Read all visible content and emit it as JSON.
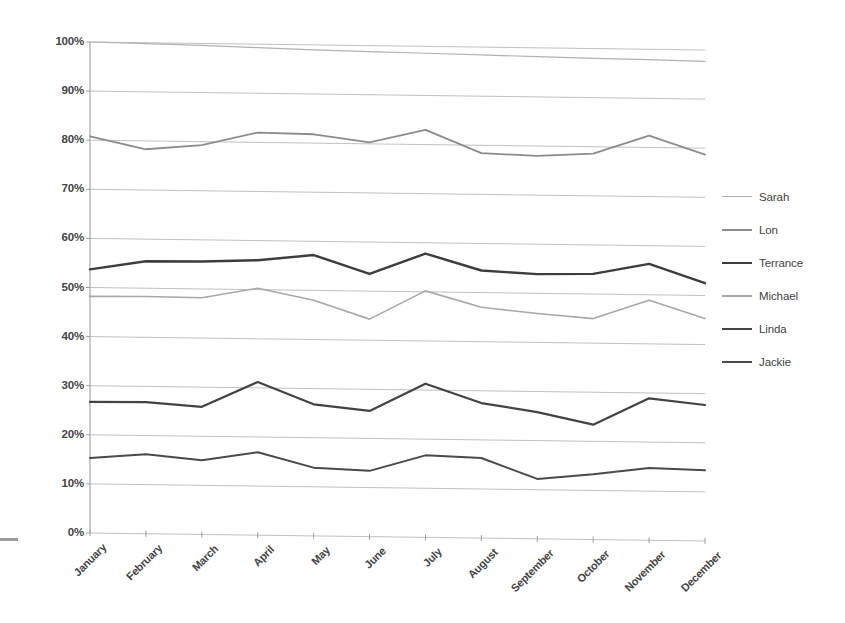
{
  "chart_data": {
    "type": "line",
    "title": "",
    "xlabel": "",
    "ylabel": "",
    "ylim": [
      0,
      100
    ],
    "ytick_values": [
      0,
      10,
      20,
      30,
      40,
      50,
      60,
      70,
      80,
      90,
      100
    ],
    "ytick_labels": [
      "0%",
      "10%",
      "20%",
      "30%",
      "40%",
      "50%",
      "60%",
      "70%",
      "80%",
      "90%",
      "100%"
    ],
    "grid": true,
    "grid_axis": "y",
    "legend_position": "right",
    "categories": [
      "January",
      "February",
      "March",
      "April",
      "May",
      "June",
      "July",
      "August",
      "September",
      "October",
      "November",
      "December"
    ],
    "series": [
      {
        "name": "Sarah",
        "color": "#b2b2b2",
        "width": 1.2,
        "values": [
          100.0,
          99.8,
          99.6,
          99.3,
          99.0,
          98.8,
          98.6,
          98.4,
          98.2,
          98.0,
          97.9,
          97.7
        ]
      },
      {
        "name": "Lon",
        "color": "#8c8c8c",
        "width": 1.8,
        "values": [
          80.8,
          78.3,
          79.3,
          82.0,
          81.8,
          80.3,
          83.0,
          78.4,
          78.0,
          78.6,
          82.4,
          78.7
        ]
      },
      {
        "name": "Terrance",
        "color": "#3d3d3d",
        "width": 2.4,
        "values": [
          53.7,
          55.5,
          55.6,
          56.0,
          57.2,
          53.5,
          57.8,
          54.5,
          53.9,
          54.1,
          56.3,
          52.5
        ]
      },
      {
        "name": "Michael",
        "color": "#a8a8a8",
        "width": 1.6,
        "values": [
          48.2,
          48.3,
          48.2,
          50.3,
          48.0,
          44.3,
          50.2,
          47.0,
          45.9,
          45.0,
          48.9,
          45.3
        ]
      },
      {
        "name": "Linda",
        "color": "#434343",
        "width": 2.2,
        "values": [
          26.7,
          26.8,
          26.0,
          31.2,
          26.8,
          25.6,
          31.3,
          27.5,
          25.8,
          23.4,
          28.9,
          27.7
        ]
      },
      {
        "name": "Jackie",
        "color": "#4a4a4a",
        "width": 2.0,
        "values": [
          15.3,
          16.2,
          15.1,
          16.9,
          13.9,
          13.4,
          16.7,
          16.3,
          12.2,
          13.3,
          14.7,
          14.4
        ]
      }
    ]
  },
  "legend": {
    "items": [
      {
        "label": "Sarah"
      },
      {
        "label": "Lon"
      },
      {
        "label": "Terrance"
      },
      {
        "label": "Michael"
      },
      {
        "label": "Linda"
      },
      {
        "label": "Jackie"
      }
    ]
  }
}
